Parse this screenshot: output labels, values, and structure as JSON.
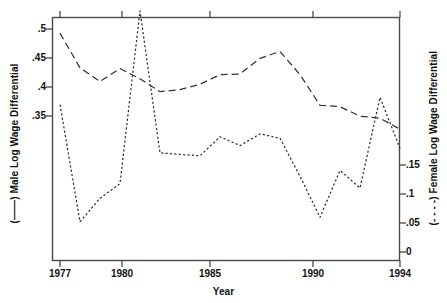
{
  "chart_data": {
    "type": "line",
    "title": "",
    "xlabel": "Year",
    "ylabel_left": "(——) Male Log Wage Differential",
    "ylabel_right": "(- - - -) Female Log Wage Differential",
    "x": [
      1977,
      1978,
      1979,
      1980,
      1981,
      1982,
      1983,
      1984,
      1985,
      1986,
      1987,
      1988,
      1989,
      1990,
      1991,
      1992,
      1993,
      1994
    ],
    "xlim": [
      1976.7,
      1994.2
    ],
    "xticks": [
      1977,
      1980,
      1985,
      1990,
      1994
    ],
    "xticklabels": [
      "1977",
      "1980",
      "1985",
      "1990",
      "1994"
    ],
    "grid": false,
    "legend": "axis-labels",
    "left_axis": {
      "ticks": [
        0.35,
        0.4,
        0.45,
        0.5
      ],
      "ticklabels": [
        ".35",
        ".4",
        ".45",
        ".5"
      ],
      "ylim": [
        0.155,
        0.512
      ]
    },
    "right_axis": {
      "ticks": [
        0,
        0.05,
        0.1,
        0.15
      ],
      "ticklabels": [
        "0",
        ".05",
        ".1",
        ".15"
      ],
      "ylim": [
        -0.0115,
        0.1545
      ]
    },
    "series": [
      {
        "name": "Male Log Wage Differential",
        "axis": "left",
        "linestyle": "dashed",
        "color": "#333333",
        "values": [
          0.489,
          0.438,
          0.418,
          0.437,
          0.422,
          0.403,
          0.406,
          0.414,
          0.428,
          0.429,
          0.452,
          0.462,
          0.428,
          0.383,
          0.381,
          0.367,
          0.364,
          0.348
        ]
      },
      {
        "name": "Female Log Wage Differential",
        "axis": "right",
        "linestyle": "dotted",
        "color": "#333333",
        "values": [
          0.095,
          0.015,
          0.031,
          0.041,
          0.159,
          0.062,
          0.061,
          0.06,
          0.073,
          0.067,
          0.075,
          0.072,
          0.046,
          0.018,
          0.05,
          0.038,
          0.1,
          0.065
        ]
      }
    ]
  },
  "axes": {
    "x_title": "Year",
    "y_left_title": "(——) Male Log Wage Differential",
    "y_right_title": "(- - - -) Female Log Wage Differential"
  },
  "ticks": {
    "left": [
      ".5",
      ".45",
      ".4",
      ".35"
    ],
    "right": [
      ".15",
      ".1",
      ".05",
      "0"
    ],
    "x": [
      "1977",
      "1980",
      "1985",
      "1990",
      "1994"
    ]
  }
}
